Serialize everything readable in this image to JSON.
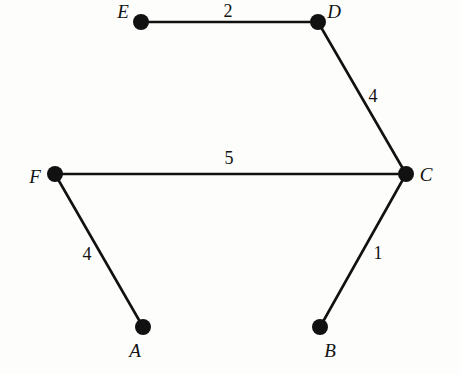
{
  "figure": {
    "kind": "weighted-undirected-graph",
    "background_color": "#fdfdfb",
    "stroke_color": "#111111",
    "node_fill_color": "#111111",
    "width": 460,
    "height": 374
  },
  "nodes": [
    {
      "id": "A",
      "label": "A",
      "x": 143,
      "y": 327,
      "r": 8,
      "label_x": 135,
      "label_y": 350
    },
    {
      "id": "B",
      "label": "B",
      "x": 320,
      "y": 327,
      "r": 8,
      "label_x": 330,
      "label_y": 350
    },
    {
      "id": "C",
      "label": "C",
      "x": 406,
      "y": 174,
      "r": 8,
      "label_x": 426,
      "label_y": 174
    },
    {
      "id": "D",
      "label": "D",
      "x": 318,
      "y": 22,
      "r": 8,
      "label_x": 334,
      "label_y": 11
    },
    {
      "id": "E",
      "label": "E",
      "x": 141,
      "y": 22,
      "r": 8,
      "label_x": 123,
      "label_y": 11
    },
    {
      "id": "F",
      "label": "F",
      "x": 55,
      "y": 174,
      "r": 8,
      "label_x": 35,
      "label_y": 176
    }
  ],
  "edges": [
    {
      "id": "E-D",
      "from": "E",
      "to": "D",
      "weight": "2",
      "label_x": 228,
      "label_y": 11
    },
    {
      "id": "D-C",
      "from": "D",
      "to": "C",
      "weight": "4",
      "label_x": 373,
      "label_y": 96
    },
    {
      "id": "F-C",
      "from": "F",
      "to": "C",
      "weight": "5",
      "label_x": 229,
      "label_y": 158
    },
    {
      "id": "C-B",
      "from": "C",
      "to": "B",
      "weight": "1",
      "label_x": 378,
      "label_y": 253
    },
    {
      "id": "F-A",
      "from": "F",
      "to": "A",
      "weight": "4",
      "label_x": 87,
      "label_y": 254
    }
  ]
}
